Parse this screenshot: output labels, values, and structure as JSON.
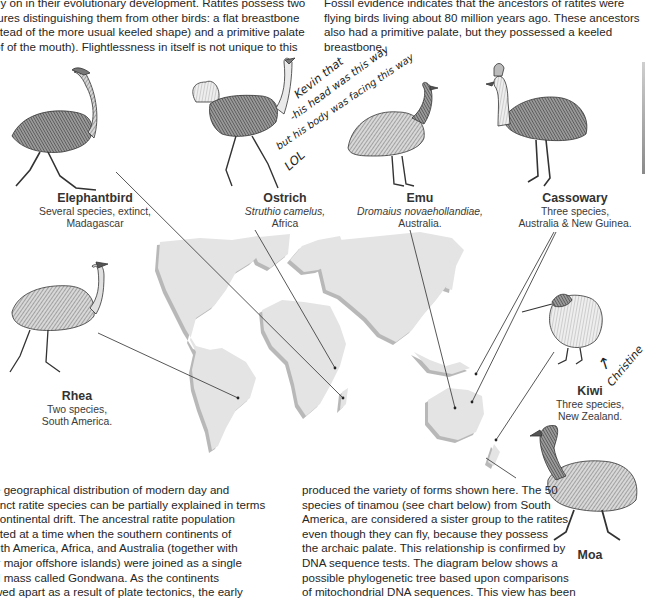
{
  "document": {
    "paragraphs": {
      "top_left": [
        "rly on in their evolutionary development. Ratites possess two",
        "tures distinguishing them from other birds: a flat breastbone",
        "stead of the more usual keeled shape) and a primitive palate",
        "of of the mouth). Flightlessness in itself is not unique to this"
      ],
      "top_right": [
        "Fossil evidence indicates that the ancestors of ratites were",
        "flying birds living about 80 million years ago. These ancestors",
        "also had a primitive palate, but they possessed a keeled",
        "breastbone."
      ],
      "bottom_left": [
        "e geographical distribution of modern day and",
        "tinct ratite species can be partially explained in terms",
        "continental drift. The ancestral ratite population",
        "sted at a time when the southern continents of",
        "uth America, Africa, and Australia (together with",
        "ir major offshore islands) were joined as a single",
        "d mass called Gondwana. As the continents",
        "wed apart as a result of plate tectonics, the early"
      ],
      "bottom_mid": [
        "produced the variety of forms shown here. The 50",
        "species of tinamou (see chart below) from South",
        "America, are considered a sister group to the ratites",
        "even though they can fly, because they possess",
        "the archaic palate. This relationship is confirmed by",
        "DNA sequence tests. The diagram below shows a",
        "possible phylogenetic tree based upon comparisons",
        "of mitochondrial DNA sequences. This view has been"
      ]
    },
    "birds": {
      "elephantbird": {
        "name": "Elephantbird",
        "lines": [
          "Several species, extinct,",
          "Madagascar"
        ]
      },
      "ostrich": {
        "name": "Ostrich",
        "sci": "Struthio camelus,",
        "lines": [
          "Africa"
        ]
      },
      "emu": {
        "name": "Emu",
        "sci": "Dromaius novaehollandiae,",
        "lines": [
          "Australia."
        ]
      },
      "cassowary": {
        "name": "Cassowary",
        "lines": [
          "Three species,",
          "Australia & New Guinea."
        ]
      },
      "rhea": {
        "name": "Rhea",
        "lines": [
          "Two species,",
          "South America."
        ]
      },
      "kiwi": {
        "name": "Kiwi",
        "lines": [
          "Three species,",
          "New Zealand."
        ]
      },
      "moa": {
        "name": "Moa"
      }
    },
    "annotations": {
      "handwriting_ostrich": [
        "Kevin that",
        "-his head was this way",
        "but his body was facing this way",
        "LOL"
      ],
      "handwriting_kiwi": "Christine",
      "arrow_kiwi": "↑"
    },
    "colors": {
      "land": "#e4e4e4",
      "land_shadow": "#b9b9b9",
      "pointer_line": "#444444",
      "ink": "#2a2a2a"
    }
  }
}
